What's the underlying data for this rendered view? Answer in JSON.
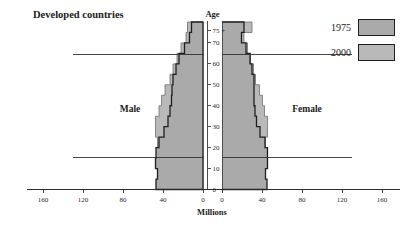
{
  "chart_data": {
    "type": "bar",
    "subtype": "population-pyramid",
    "title": "Developed countries",
    "xlabel": "Millions",
    "ylabel": "Age",
    "left_group_label": "Male",
    "right_group_label": "Female",
    "xticks_left": [
      "160",
      "120",
      "80",
      "40",
      "0"
    ],
    "xticks_right": [
      "0",
      "40",
      "80",
      "120",
      "160"
    ],
    "xlim": [
      0,
      170
    ],
    "yticks": [
      "0",
      "10",
      "20",
      "30",
      "40",
      "50",
      "60",
      "70",
      "75 +"
    ],
    "ylim": [
      0,
      80
    ],
    "age_groups": [
      "0-4",
      "5-9",
      "10-14",
      "15-19",
      "20-24",
      "25-29",
      "30-34",
      "35-39",
      "40-44",
      "45-49",
      "50-54",
      "55-59",
      "60-64",
      "65-69",
      "70-74",
      "75+"
    ],
    "grid": false,
    "legend_position": "top-right",
    "reference_lines": [
      {
        "label": "age-15-line",
        "age": 15.5
      },
      {
        "label": "age-65-line",
        "age": 64.5
      }
    ],
    "series": [
      {
        "name": "1975",
        "color": "#aaaaaa",
        "male": [
          47.0,
          45.5,
          47.5,
          47.0,
          44.0,
          39.0,
          35.0,
          33.0,
          31.5,
          31.0,
          30.0,
          27.0,
          24.0,
          18.5,
          13.5,
          11.5
        ],
        "female": [
          45.0,
          43.5,
          45.5,
          45.5,
          43.0,
          38.0,
          34.5,
          33.0,
          32.0,
          32.0,
          32.0,
          30.0,
          28.0,
          24.0,
          19.5,
          22.0
        ]
      },
      {
        "name": "2000",
        "color": "#b9b9b9",
        "male": [
          39.0,
          39.5,
          41.0,
          44.0,
          45.5,
          47.5,
          47.5,
          44.0,
          41.5,
          38.0,
          33.0,
          30.0,
          26.0,
          22.0,
          17.0,
          15.5
        ],
        "female": [
          37.5,
          38.0,
          39.0,
          42.0,
          43.5,
          45.5,
          45.5,
          42.5,
          40.5,
          37.5,
          33.5,
          31.5,
          28.5,
          25.5,
          22.0,
          30.0
        ]
      }
    ]
  },
  "legend": {
    "entries": [
      {
        "label": "1975",
        "color": "#aaaaaa"
      },
      {
        "label": "2000",
        "color": "#b9b9b9"
      }
    ]
  },
  "axes": {
    "age_axis_title": "Age",
    "value_axis_title": "Millions"
  }
}
